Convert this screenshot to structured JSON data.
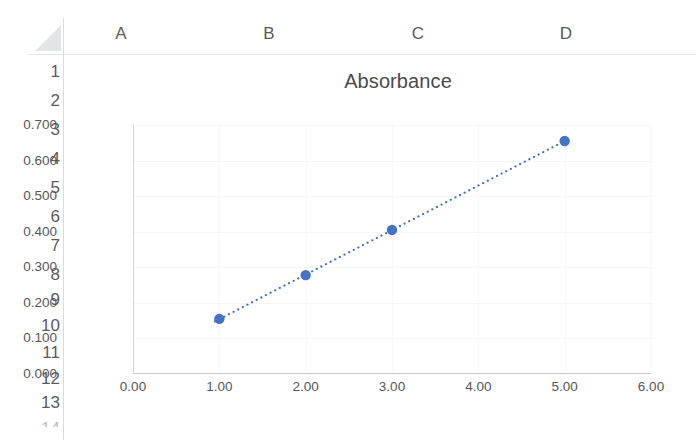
{
  "app": {
    "type": "spreadsheet",
    "select_all_icon": "select-all-triangle-icon"
  },
  "grid": {
    "columns": [
      "A",
      "B",
      "C",
      "D"
    ],
    "rows": [
      "1",
      "2",
      "3",
      "4",
      "5",
      "6",
      "7",
      "8",
      "9",
      "10",
      "11",
      "12",
      "13",
      "14"
    ]
  },
  "colors": {
    "series_blue": "#4472C4",
    "axis_line": "#c9c9c9",
    "gridline": "#f2f3f5",
    "header_text": "#5b5b5b",
    "tick_text": "#575757",
    "title_text": "#4b4b4b"
  },
  "chart_data": {
    "type": "scatter",
    "title": "Absorbance",
    "xlabel": "",
    "ylabel": "",
    "xlim": [
      0.0,
      6.0
    ],
    "ylim": [
      0.0,
      0.7
    ],
    "xticks": [
      "0.00",
      "1.00",
      "2.00",
      "3.00",
      "4.00",
      "5.00",
      "6.00"
    ],
    "xtick_values": [
      0.0,
      1.0,
      2.0,
      3.0,
      4.0,
      5.0,
      6.0
    ],
    "yticks": [
      "0.000",
      "0.100",
      "0.200",
      "0.300",
      "0.400",
      "0.500",
      "0.600",
      "0.700"
    ],
    "ytick_values": [
      0.0,
      0.1,
      0.2,
      0.3,
      0.4,
      0.5,
      0.6,
      0.7
    ],
    "grid": true,
    "legend": "none",
    "series": [
      {
        "name": "Absorbance",
        "marker": "circle",
        "marker_color": "#4472C4",
        "trendline": "dotted",
        "trendline_color": "#4472C4",
        "x": [
          1.0,
          2.0,
          3.0,
          5.0
        ],
        "y": [
          0.155,
          0.278,
          0.405,
          0.655
        ]
      }
    ]
  }
}
